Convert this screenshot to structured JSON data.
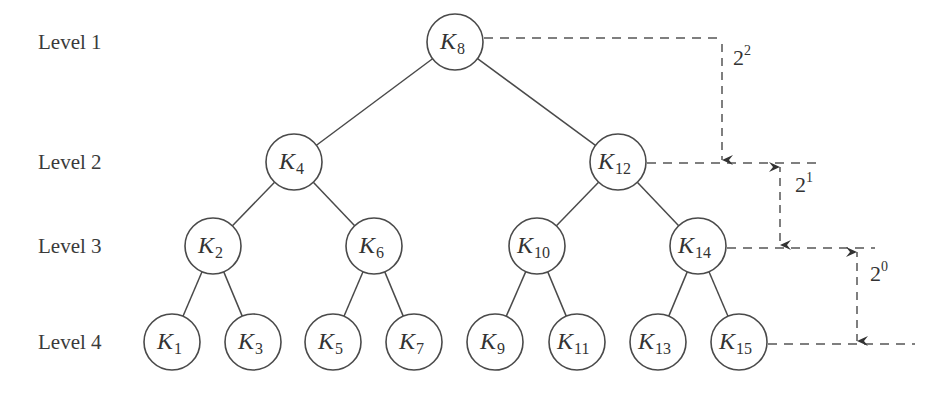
{
  "diagram": {
    "type": "binary-search-tree",
    "level_labels": [
      "Level 1",
      "Level 2",
      "Level 3",
      "Level 4"
    ],
    "nodes": [
      {
        "id": "K8",
        "base": "K",
        "sub": "8",
        "level": 1,
        "cx": 455,
        "cy": 42
      },
      {
        "id": "K4",
        "base": "K",
        "sub": "4",
        "level": 2,
        "cx": 294,
        "cy": 162
      },
      {
        "id": "K12",
        "base": "K",
        "sub": "12",
        "level": 2,
        "cx": 618,
        "cy": 162
      },
      {
        "id": "K2",
        "base": "K",
        "sub": "2",
        "level": 3,
        "cx": 213,
        "cy": 246
      },
      {
        "id": "K6",
        "base": "K",
        "sub": "6",
        "level": 3,
        "cx": 374,
        "cy": 246
      },
      {
        "id": "K10",
        "base": "K",
        "sub": "10",
        "level": 3,
        "cx": 537,
        "cy": 246
      },
      {
        "id": "K14",
        "base": "K",
        "sub": "14",
        "level": 3,
        "cx": 698,
        "cy": 246
      },
      {
        "id": "K1",
        "base": "K",
        "sub": "1",
        "level": 4,
        "cx": 172,
        "cy": 342
      },
      {
        "id": "K3",
        "base": "K",
        "sub": "3",
        "level": 4,
        "cx": 253,
        "cy": 342
      },
      {
        "id": "K5",
        "base": "K",
        "sub": "5",
        "level": 4,
        "cx": 333,
        "cy": 342
      },
      {
        "id": "K7",
        "base": "K",
        "sub": "7",
        "level": 4,
        "cx": 414,
        "cy": 342
      },
      {
        "id": "K9",
        "base": "K",
        "sub": "9",
        "level": 4,
        "cx": 495,
        "cy": 342
      },
      {
        "id": "K11",
        "base": "K",
        "sub": "11",
        "level": 4,
        "cx": 577,
        "cy": 342
      },
      {
        "id": "K13",
        "base": "K",
        "sub": "13",
        "level": 4,
        "cx": 658,
        "cy": 342
      },
      {
        "id": "K15",
        "base": "K",
        "sub": "15",
        "level": 4,
        "cx": 739,
        "cy": 342
      }
    ],
    "edges": [
      [
        "K8",
        "K4"
      ],
      [
        "K8",
        "K12"
      ],
      [
        "K4",
        "K2"
      ],
      [
        "K4",
        "K6"
      ],
      [
        "K12",
        "K10"
      ],
      [
        "K12",
        "K14"
      ],
      [
        "K2",
        "K1"
      ],
      [
        "K2",
        "K3"
      ],
      [
        "K6",
        "K5"
      ],
      [
        "K6",
        "K7"
      ],
      [
        "K10",
        "K9"
      ],
      [
        "K10",
        "K11"
      ],
      [
        "K14",
        "K13"
      ],
      [
        "K14",
        "K15"
      ]
    ],
    "dimensions": [
      {
        "base": "2",
        "exp": "2",
        "from_node": "K8",
        "to_node": "K12"
      },
      {
        "base": "2",
        "exp": "1",
        "from_node": "K12",
        "to_node": "K14"
      },
      {
        "base": "2",
        "exp": "0",
        "from_node": "K14",
        "to_node": "K15"
      }
    ]
  }
}
